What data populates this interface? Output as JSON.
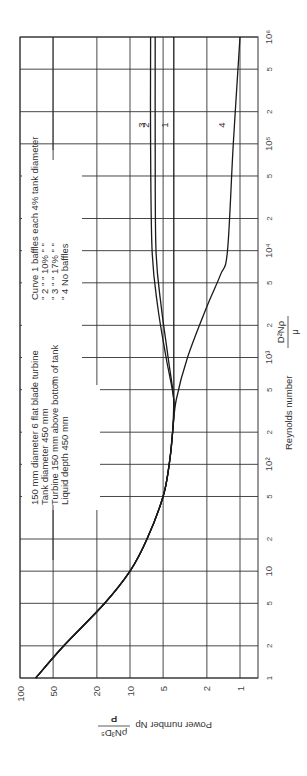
{
  "chart_data": {
    "type": "line",
    "orientation": "rotated-90-ccw",
    "title": "",
    "xlabel": "Reynolds number",
    "xlabel_formula": {
      "numerator": "D²Nρ",
      "denominator": "μ"
    },
    "ylabel": "Power number Np",
    "ylabel_formula": {
      "numerator": "P",
      "denominator": "ρN³D⁵"
    },
    "xscale": "log",
    "yscale": "log",
    "xlim": [
      1,
      1000000
    ],
    "ylim": [
      1,
      100
    ],
    "grid": true,
    "x_ticks": [
      {
        "value": 1,
        "label": "1"
      },
      {
        "value": 2,
        "label": "2"
      },
      {
        "value": 5,
        "label": "5"
      },
      {
        "value": 10,
        "label": "10"
      },
      {
        "value": 20,
        "label": "2"
      },
      {
        "value": 50,
        "label": "5"
      },
      {
        "value": 100,
        "label": "10²"
      },
      {
        "value": 200,
        "label": "2"
      },
      {
        "value": 500,
        "label": "5"
      },
      {
        "value": 1000,
        "label": "10³"
      },
      {
        "value": 2000,
        "label": "2"
      },
      {
        "value": 5000,
        "label": "5"
      },
      {
        "value": 10000,
        "label": "10⁴"
      },
      {
        "value": 20000,
        "label": "2"
      },
      {
        "value": 50000,
        "label": "5"
      },
      {
        "value": 100000,
        "label": "10⁵"
      },
      {
        "value": 200000,
        "label": "2"
      },
      {
        "value": 500000,
        "label": "5"
      },
      {
        "value": 1000000,
        "label": "10⁶"
      }
    ],
    "y_ticks": [
      {
        "value": 100,
        "label": "100"
      },
      {
        "value": 50,
        "label": "50"
      },
      {
        "value": 20,
        "label": "20"
      },
      {
        "value": 10,
        "label": "10"
      },
      {
        "value": 5,
        "label": "5"
      },
      {
        "value": 2,
        "label": "2"
      },
      {
        "value": 1,
        "label": "1"
      }
    ],
    "series": [
      {
        "name": "Curve 1 – baffles each 4% tank diameter",
        "label": "1",
        "x": [
          1,
          2,
          5,
          10,
          20,
          50,
          100,
          200,
          400,
          1000,
          10000,
          100000,
          1000000
        ],
        "y": [
          72,
          40,
          17,
          10,
          7,
          5,
          4.4,
          4.1,
          4.0,
          4.0,
          4.0,
          4.0,
          4.0
        ]
      },
      {
        "name": "Curve 2 – baffles each 10% tank diameter",
        "label": "2",
        "x": [
          1,
          2,
          5,
          10,
          20,
          50,
          100,
          200,
          400,
          1000,
          3000,
          10000,
          100000,
          1000000
        ],
        "y": [
          72,
          40,
          17,
          10,
          7,
          5,
          4.4,
          4.1,
          4.0,
          4.5,
          5.2,
          5.8,
          5.9,
          5.9
        ]
      },
      {
        "name": "Curve 3 – baffles each 17% tank diameter",
        "label": "3",
        "x": [
          1,
          2,
          5,
          10,
          20,
          50,
          100,
          200,
          400,
          1000,
          3000,
          10000,
          100000,
          1000000
        ],
        "y": [
          72,
          40,
          17,
          10,
          7,
          5,
          4.4,
          4.1,
          4.0,
          4.7,
          5.6,
          6.3,
          6.5,
          6.5
        ]
      },
      {
        "name": "Curve 4 – no baffles",
        "label": "4",
        "x": [
          1,
          2,
          5,
          10,
          20,
          50,
          100,
          200,
          400,
          1000,
          3000,
          6000,
          10000,
          100000,
          1000000
        ],
        "y": [
          72,
          40,
          17,
          10,
          7,
          5,
          4.4,
          4.1,
          3.8,
          3.0,
          2.0,
          1.5,
          1.3,
          1.15,
          1.0
        ]
      }
    ],
    "curve_label_position_re": 150000,
    "annotations": [
      "150 mm diameter 6 flat blade turbine",
      "Tank diameter 450 mm",
      "Turbine 150 mm above bottom of tank",
      "Liquid depth 450 mm"
    ],
    "legend": [
      "Curve 1 baffles each 4% tank diameter",
      "\"   2    \"      \"    10% \"      \"",
      "\"   3    \"      \"    17% \"      \"",
      "\"   4 No baffles"
    ]
  },
  "labels": {
    "x_axis_title": "Reynolds number",
    "x_formula_num": "D²Nρ",
    "x_formula_den": "μ",
    "y_axis_title": "Power number Np",
    "y_formula_num": "P",
    "y_formula_den": "ρN³D⁵"
  }
}
